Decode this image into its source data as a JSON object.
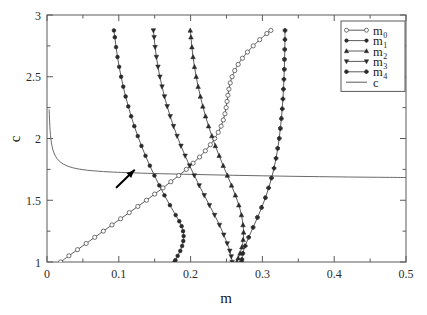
{
  "chart_data": {
    "type": "line",
    "title": "",
    "xlabel": "m",
    "ylabel": "c",
    "xlim": [
      0,
      0.5
    ],
    "ylim": [
      1,
      3
    ],
    "xticks": [
      "0",
      "0.1",
      "0.2",
      "0.3",
      "0.4",
      "0.5"
    ],
    "xtick_values": [
      0,
      0.1,
      0.2,
      0.3,
      0.4,
      0.5
    ],
    "xminor_values": [
      0.05,
      0.15,
      0.25,
      0.35,
      0.45
    ],
    "yticks": [
      "1",
      "1.5",
      "2",
      "2.5",
      "3"
    ],
    "ytick_values": [
      1,
      1.5,
      2,
      2.5,
      3
    ],
    "yminor_values": [
      1.25,
      1.75,
      2.25,
      2.75
    ],
    "grid": false,
    "legend_position": "top-right",
    "annotation": {
      "name": "arrow",
      "tail_m": 0.097,
      "tail_c": 1.605,
      "head_m": 0.1215,
      "head_c": 1.742
    },
    "series": [
      {
        "name": "m_0",
        "label": "m",
        "subscript": "0",
        "marker": "open-circle",
        "linestyle": "solid",
        "points": [
          [
            0.019,
            1.0
          ],
          [
            0.0305,
            1.05
          ],
          [
            0.0425,
            1.1
          ],
          [
            0.0545,
            1.15
          ],
          [
            0.0665,
            1.2
          ],
          [
            0.0785,
            1.25
          ],
          [
            0.0905,
            1.3
          ],
          [
            0.1025,
            1.35
          ],
          [
            0.1145,
            1.4
          ],
          [
            0.1265,
            1.45
          ],
          [
            0.1385,
            1.5
          ],
          [
            0.15,
            1.55
          ],
          [
            0.1615,
            1.6
          ],
          [
            0.1725,
            1.65
          ],
          [
            0.1835,
            1.7
          ],
          [
            0.194,
            1.75
          ],
          [
            0.2035,
            1.8
          ],
          [
            0.2125,
            1.85
          ],
          [
            0.2205,
            1.9
          ],
          [
            0.2275,
            1.95
          ],
          [
            0.2335,
            2.0
          ],
          [
            0.2385,
            2.05
          ],
          [
            0.2425,
            2.1
          ],
          [
            0.2455,
            2.15
          ],
          [
            0.2478,
            2.2
          ],
          [
            0.2495,
            2.25
          ],
          [
            0.2508,
            2.3
          ],
          [
            0.252,
            2.35
          ],
          [
            0.2534,
            2.4
          ],
          [
            0.2552,
            2.45
          ],
          [
            0.2578,
            2.5
          ],
          [
            0.2615,
            2.55
          ],
          [
            0.2663,
            2.6
          ],
          [
            0.2722,
            2.65
          ],
          [
            0.2792,
            2.7
          ],
          [
            0.2872,
            2.75
          ],
          [
            0.2962,
            2.8
          ],
          [
            0.3062,
            2.85
          ],
          [
            0.3118,
            2.875
          ]
        ]
      },
      {
        "name": "m_1",
        "label": "m",
        "subscript": "1",
        "marker": "solid-circle",
        "linestyle": "solid",
        "points": [
          [
            0.0932,
            2.875
          ],
          [
            0.0945,
            2.82
          ],
          [
            0.0962,
            2.74
          ],
          [
            0.0982,
            2.66
          ],
          [
            0.1005,
            2.58
          ],
          [
            0.1032,
            2.5
          ],
          [
            0.1062,
            2.42
          ],
          [
            0.1095,
            2.34
          ],
          [
            0.1132,
            2.26
          ],
          [
            0.1172,
            2.18
          ],
          [
            0.1216,
            2.1
          ],
          [
            0.1264,
            2.02
          ],
          [
            0.1316,
            1.94
          ],
          [
            0.1372,
            1.86
          ],
          [
            0.1432,
            1.78
          ],
          [
            0.1496,
            1.7
          ],
          [
            0.1564,
            1.62
          ],
          [
            0.1636,
            1.54
          ],
          [
            0.1712,
            1.46
          ],
          [
            0.1792,
            1.38
          ],
          [
            0.1842,
            1.33
          ],
          [
            0.1875,
            1.29
          ],
          [
            0.1895,
            1.25
          ],
          [
            0.1903,
            1.21
          ],
          [
            0.1898,
            1.17
          ],
          [
            0.1882,
            1.13
          ],
          [
            0.1856,
            1.09
          ],
          [
            0.182,
            1.05
          ],
          [
            0.1788,
            1.015
          ],
          [
            0.1775,
            1.0
          ]
        ]
      },
      {
        "name": "m_2",
        "label": "m",
        "subscript": "2",
        "marker": "triangle-up",
        "linestyle": "solid",
        "points": [
          [
            0.1995,
            2.875
          ],
          [
            0.2005,
            2.82
          ],
          [
            0.2018,
            2.74
          ],
          [
            0.2034,
            2.66
          ],
          [
            0.2054,
            2.58
          ],
          [
            0.2078,
            2.5
          ],
          [
            0.2105,
            2.42
          ],
          [
            0.2136,
            2.34
          ],
          [
            0.217,
            2.26
          ],
          [
            0.2208,
            2.18
          ],
          [
            0.225,
            2.1
          ],
          [
            0.2296,
            2.02
          ],
          [
            0.2345,
            1.94
          ],
          [
            0.2398,
            1.86
          ],
          [
            0.2454,
            1.78
          ],
          [
            0.2512,
            1.7
          ],
          [
            0.257,
            1.62
          ],
          [
            0.2624,
            1.54
          ],
          [
            0.2672,
            1.46
          ],
          [
            0.2708,
            1.38
          ],
          [
            0.273,
            1.3
          ],
          [
            0.2738,
            1.24
          ],
          [
            0.2732,
            1.18
          ],
          [
            0.2714,
            1.12
          ],
          [
            0.2688,
            1.07
          ],
          [
            0.2662,
            1.03
          ],
          [
            0.2645,
            1.0
          ]
        ]
      },
      {
        "name": "m_3",
        "label": "m",
        "subscript": "3",
        "marker": "triangle-down",
        "linestyle": "solid",
        "points": [
          [
            0.1482,
            2.875
          ],
          [
            0.1492,
            2.82
          ],
          [
            0.1506,
            2.74
          ],
          [
            0.1524,
            2.66
          ],
          [
            0.1546,
            2.58
          ],
          [
            0.1572,
            2.5
          ],
          [
            0.1602,
            2.42
          ],
          [
            0.1636,
            2.34
          ],
          [
            0.1674,
            2.26
          ],
          [
            0.1716,
            2.18
          ],
          [
            0.1762,
            2.1
          ],
          [
            0.1812,
            2.02
          ],
          [
            0.1866,
            1.94
          ],
          [
            0.1924,
            1.86
          ],
          [
            0.1986,
            1.78
          ],
          [
            0.2052,
            1.7
          ],
          [
            0.212,
            1.62
          ],
          [
            0.219,
            1.54
          ],
          [
            0.2262,
            1.46
          ],
          [
            0.2334,
            1.38
          ],
          [
            0.2402,
            1.3
          ],
          [
            0.2462,
            1.22
          ],
          [
            0.251,
            1.15
          ],
          [
            0.2545,
            1.09
          ],
          [
            0.2566,
            1.045
          ],
          [
            0.2578,
            1.0
          ]
        ]
      },
      {
        "name": "m_4",
        "label": "m",
        "subscript": "4",
        "marker": "plus-dot",
        "linestyle": "solid",
        "points": [
          [
            0.3315,
            2.875
          ],
          [
            0.3314,
            2.8
          ],
          [
            0.3312,
            2.72
          ],
          [
            0.3309,
            2.64
          ],
          [
            0.3305,
            2.56
          ],
          [
            0.33,
            2.48
          ],
          [
            0.3294,
            2.4
          ],
          [
            0.3286,
            2.32
          ],
          [
            0.3276,
            2.24
          ],
          [
            0.3264,
            2.16
          ],
          [
            0.325,
            2.08
          ],
          [
            0.3234,
            2.0
          ],
          [
            0.3214,
            1.92
          ],
          [
            0.319,
            1.84
          ],
          [
            0.3162,
            1.76
          ],
          [
            0.3128,
            1.68
          ],
          [
            0.3088,
            1.6
          ],
          [
            0.3042,
            1.52
          ],
          [
            0.299,
            1.44
          ],
          [
            0.2932,
            1.36
          ],
          [
            0.287,
            1.28
          ],
          [
            0.281,
            1.2
          ],
          [
            0.276,
            1.13
          ],
          [
            0.2728,
            1.07
          ],
          [
            0.2715,
            1.02
          ],
          [
            0.2712,
            1.0
          ]
        ]
      },
      {
        "name": "c",
        "label": "c",
        "subscript": "",
        "marker": "none",
        "linestyle": "solid",
        "points": [
          [
            0.003,
            2.235
          ],
          [
            0.0036,
            2.14
          ],
          [
            0.0044,
            2.06
          ],
          [
            0.0054,
            1.995
          ],
          [
            0.0068,
            1.945
          ],
          [
            0.0086,
            1.902
          ],
          [
            0.011,
            1.866
          ],
          [
            0.014,
            1.838
          ],
          [
            0.018,
            1.812
          ],
          [
            0.023,
            1.792
          ],
          [
            0.029,
            1.776
          ],
          [
            0.036,
            1.763
          ],
          [
            0.045,
            1.752
          ],
          [
            0.056,
            1.743
          ],
          [
            0.07,
            1.736
          ],
          [
            0.088,
            1.729
          ],
          [
            0.11,
            1.724
          ],
          [
            0.14,
            1.718
          ],
          [
            0.18,
            1.712
          ],
          [
            0.22,
            1.707
          ],
          [
            0.26,
            1.702
          ],
          [
            0.3,
            1.698
          ],
          [
            0.34,
            1.694
          ],
          [
            0.38,
            1.691
          ],
          [
            0.42,
            1.688
          ],
          [
            0.46,
            1.686
          ],
          [
            0.5,
            1.684
          ]
        ]
      }
    ]
  },
  "legend": {
    "entries": [
      {
        "label": "m",
        "sub": "0",
        "marker": "open-circle"
      },
      {
        "label": "m",
        "sub": "1",
        "marker": "solid-circle"
      },
      {
        "label": "m",
        "sub": "2",
        "marker": "triangle-up"
      },
      {
        "label": "m",
        "sub": "3",
        "marker": "triangle-down"
      },
      {
        "label": "m",
        "sub": "4",
        "marker": "plus-dot"
      },
      {
        "label": "c",
        "sub": "",
        "marker": "none"
      }
    ]
  },
  "colors": {
    "background": "#ffffff",
    "axis": "#5a5a5a",
    "curve": "#4a4a4a",
    "curve_c": "#6a6a6a",
    "marker_fill": "#2a2a2a",
    "text": "#1a1a1a",
    "annotation": "#000000"
  }
}
